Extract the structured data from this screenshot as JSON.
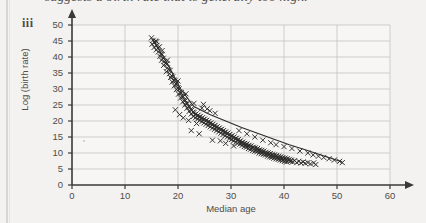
{
  "caption": {
    "text": "suggests a birth rate that is generally too high.",
    "list_marker": "iii"
  },
  "chart_data": {
    "type": "scatter",
    "title": "",
    "xlabel": "Median age",
    "ylabel": "Log (birth rate)",
    "xlim": [
      0,
      60
    ],
    "ylim": [
      0,
      50
    ],
    "xticks": [
      0,
      10,
      20,
      30,
      40,
      50,
      60
    ],
    "yticks": [
      0,
      5,
      10,
      15,
      20,
      25,
      30,
      35,
      40,
      45,
      50
    ],
    "grid": true,
    "grid_color": "#bdbbb8",
    "marker": "x",
    "marker_color": "#2b2a28",
    "axis_color": "#3a3937",
    "axis_arrows": true,
    "legend": "none",
    "trend_line": {
      "visible": true,
      "color": "#2b2a28",
      "x": [
        15.2,
        18.0,
        20.5,
        23.0,
        26.0,
        29.0,
        32.0,
        35.0,
        38.0,
        41.0,
        44.0,
        47.0,
        51.0
      ],
      "y": [
        45.5,
        38.0,
        30.0,
        24.5,
        22.0,
        20.0,
        18.0,
        16.2,
        14.4,
        12.6,
        11.0,
        9.4,
        7.2
      ]
    },
    "points": [
      [
        15.0,
        46.0
      ],
      [
        15.3,
        45.2
      ],
      [
        15.6,
        44.6
      ],
      [
        15.1,
        44.0
      ],
      [
        15.8,
        45.0
      ],
      [
        16.0,
        43.6
      ],
      [
        16.2,
        42.8
      ],
      [
        15.9,
        42.2
      ],
      [
        16.5,
        43.2
      ],
      [
        16.3,
        41.6
      ],
      [
        16.8,
        41.0
      ],
      [
        16.6,
        40.2
      ],
      [
        17.0,
        40.8
      ],
      [
        17.2,
        39.6
      ],
      [
        16.9,
        39.0
      ],
      [
        17.4,
        38.6
      ],
      [
        17.6,
        38.0
      ],
      [
        17.3,
        37.4
      ],
      [
        17.9,
        37.8
      ],
      [
        18.0,
        36.6
      ],
      [
        18.2,
        36.0
      ],
      [
        17.8,
        35.4
      ],
      [
        18.5,
        35.8
      ],
      [
        18.4,
        34.8
      ],
      [
        18.8,
        34.2
      ],
      [
        18.6,
        33.6
      ],
      [
        19.0,
        33.8
      ],
      [
        19.2,
        32.8
      ],
      [
        18.9,
        32.2
      ],
      [
        19.4,
        32.6
      ],
      [
        19.6,
        31.6
      ],
      [
        19.3,
        31.0
      ],
      [
        19.8,
        31.4
      ],
      [
        20.0,
        30.4
      ],
      [
        19.7,
        29.8
      ],
      [
        20.2,
        30.0
      ],
      [
        20.4,
        29.0
      ],
      [
        20.1,
        28.4
      ],
      [
        20.6,
        28.8
      ],
      [
        20.8,
        27.8
      ],
      [
        20.5,
        27.2
      ],
      [
        21.0,
        27.6
      ],
      [
        21.2,
        26.6
      ],
      [
        20.9,
        26.0
      ],
      [
        21.4,
        26.4
      ],
      [
        21.6,
        25.6
      ],
      [
        21.3,
        25.0
      ],
      [
        21.8,
        25.4
      ],
      [
        22.0,
        24.6
      ],
      [
        21.7,
        24.0
      ],
      [
        22.2,
        24.4
      ],
      [
        22.4,
        23.6
      ],
      [
        22.1,
        23.0
      ],
      [
        22.6,
        23.4
      ],
      [
        22.8,
        22.8
      ],
      [
        22.5,
        22.2
      ],
      [
        23.0,
        22.6
      ],
      [
        23.2,
        22.0
      ],
      [
        22.9,
        21.4
      ],
      [
        23.4,
        22.2
      ],
      [
        23.6,
        21.6
      ],
      [
        23.3,
        21.0
      ],
      [
        23.8,
        21.8
      ],
      [
        24.0,
        21.2
      ],
      [
        23.7,
        20.6
      ],
      [
        24.2,
        21.4
      ],
      [
        24.4,
        20.8
      ],
      [
        24.1,
        20.2
      ],
      [
        24.6,
        21.0
      ],
      [
        24.8,
        20.4
      ],
      [
        24.5,
        19.8
      ],
      [
        25.0,
        20.6
      ],
      [
        25.2,
        20.0
      ],
      [
        24.9,
        19.4
      ],
      [
        25.4,
        20.2
      ],
      [
        25.6,
        19.6
      ],
      [
        25.3,
        19.0
      ],
      [
        25.8,
        19.8
      ],
      [
        26.0,
        19.2
      ],
      [
        25.7,
        18.6
      ],
      [
        26.2,
        19.4
      ],
      [
        26.4,
        18.8
      ],
      [
        26.1,
        18.2
      ],
      [
        26.6,
        19.0
      ],
      [
        26.8,
        18.4
      ],
      [
        26.5,
        17.8
      ],
      [
        27.0,
        18.6
      ],
      [
        27.2,
        18.0
      ],
      [
        26.9,
        17.4
      ],
      [
        27.4,
        18.2
      ],
      [
        27.6,
        17.6
      ],
      [
        27.3,
        17.0
      ],
      [
        27.8,
        17.8
      ],
      [
        28.0,
        17.2
      ],
      [
        27.7,
        16.6
      ],
      [
        28.2,
        17.4
      ],
      [
        28.4,
        16.8
      ],
      [
        28.1,
        16.2
      ],
      [
        28.6,
        17.0
      ],
      [
        28.8,
        16.4
      ],
      [
        28.5,
        15.8
      ],
      [
        29.0,
        16.6
      ],
      [
        29.2,
        16.0
      ],
      [
        28.9,
        15.4
      ],
      [
        29.4,
        16.2
      ],
      [
        29.6,
        15.6
      ],
      [
        29.3,
        15.0
      ],
      [
        29.8,
        15.8
      ],
      [
        30.0,
        15.2
      ],
      [
        29.7,
        14.6
      ],
      [
        30.2,
        15.4
      ],
      [
        30.4,
        14.8
      ],
      [
        30.1,
        14.2
      ],
      [
        30.6,
        15.0
      ],
      [
        30.8,
        14.4
      ],
      [
        30.5,
        13.8
      ],
      [
        31.0,
        14.6
      ],
      [
        31.2,
        14.0
      ],
      [
        30.9,
        13.4
      ],
      [
        31.4,
        14.2
      ],
      [
        31.6,
        13.6
      ],
      [
        31.3,
        13.0
      ],
      [
        31.8,
        13.8
      ],
      [
        32.0,
        13.2
      ],
      [
        31.7,
        12.8
      ],
      [
        32.2,
        13.4
      ],
      [
        32.4,
        12.9
      ],
      [
        32.1,
        12.4
      ],
      [
        32.6,
        13.0
      ],
      [
        32.8,
        12.6
      ],
      [
        32.5,
        12.0
      ],
      [
        33.0,
        12.8
      ],
      [
        33.2,
        12.2
      ],
      [
        32.9,
        11.8
      ],
      [
        33.4,
        12.4
      ],
      [
        33.6,
        12.0
      ],
      [
        33.3,
        11.4
      ],
      [
        33.8,
        12.2
      ],
      [
        34.0,
        11.6
      ],
      [
        33.7,
        11.2
      ],
      [
        34.2,
        11.8
      ],
      [
        34.4,
        11.4
      ],
      [
        34.1,
        10.8
      ],
      [
        34.6,
        11.6
      ],
      [
        34.8,
        11.0
      ],
      [
        34.5,
        10.6
      ],
      [
        35.0,
        11.4
      ],
      [
        35.2,
        10.8
      ],
      [
        34.9,
        10.4
      ],
      [
        35.4,
        11.0
      ],
      [
        35.6,
        10.6
      ],
      [
        35.3,
        10.0
      ],
      [
        35.8,
        10.8
      ],
      [
        36.0,
        10.4
      ],
      [
        35.7,
        9.8
      ],
      [
        36.2,
        10.6
      ],
      [
        36.4,
        10.0
      ],
      [
        36.1,
        9.6
      ],
      [
        36.6,
        10.2
      ],
      [
        36.8,
        9.8
      ],
      [
        36.5,
        9.4
      ],
      [
        37.0,
        10.0
      ],
      [
        37.2,
        9.6
      ],
      [
        36.9,
        9.0
      ],
      [
        37.4,
        9.8
      ],
      [
        37.6,
        9.2
      ],
      [
        37.3,
        8.8
      ],
      [
        37.8,
        9.6
      ],
      [
        38.0,
        9.0
      ],
      [
        37.7,
        8.6
      ],
      [
        38.2,
        9.4
      ],
      [
        38.4,
        8.8
      ],
      [
        38.1,
        8.4
      ],
      [
        38.6,
        9.2
      ],
      [
        38.8,
        8.6
      ],
      [
        38.5,
        8.2
      ],
      [
        39.0,
        9.0
      ],
      [
        39.2,
        8.4
      ],
      [
        38.9,
        8.0
      ],
      [
        39.4,
        8.8
      ],
      [
        39.6,
        8.2
      ],
      [
        39.3,
        7.8
      ],
      [
        39.8,
        8.6
      ],
      [
        40.0,
        8.0
      ],
      [
        39.7,
        7.6
      ],
      [
        40.2,
        8.4
      ],
      [
        40.4,
        7.8
      ],
      [
        40.1,
        7.4
      ],
      [
        40.6,
        8.2
      ],
      [
        40.8,
        7.6
      ],
      [
        40.5,
        7.2
      ],
      [
        41.0,
        8.0
      ],
      [
        41.2,
        7.4
      ],
      [
        41.4,
        7.8
      ],
      [
        41.6,
        7.2
      ],
      [
        42.0,
        7.6
      ],
      [
        42.4,
        7.0
      ],
      [
        42.8,
        7.4
      ],
      [
        43.2,
        6.9
      ],
      [
        43.6,
        7.2
      ],
      [
        44.0,
        6.8
      ],
      [
        44.5,
        7.0
      ],
      [
        45.0,
        6.6
      ],
      [
        45.6,
        6.9
      ],
      [
        46.0,
        6.4
      ],
      [
        19.5,
        23.5
      ],
      [
        20.3,
        22.0
      ],
      [
        21.0,
        21.0
      ],
      [
        22.0,
        20.2
      ],
      [
        23.5,
        19.2
      ],
      [
        24.5,
        24.0
      ],
      [
        25.5,
        23.8
      ],
      [
        26.0,
        23.2
      ],
      [
        27.0,
        22.4
      ],
      [
        28.0,
        13.8
      ],
      [
        29.0,
        13.0
      ],
      [
        30.5,
        12.2
      ],
      [
        26.5,
        14.0
      ],
      [
        24.0,
        16.0
      ],
      [
        22.5,
        17.0
      ],
      [
        31.5,
        17.0
      ],
      [
        33.0,
        16.0
      ],
      [
        34.5,
        15.0
      ],
      [
        36.0,
        14.0
      ],
      [
        37.5,
        13.2
      ],
      [
        38.5,
        12.6
      ],
      [
        40.0,
        12.0
      ],
      [
        41.5,
        11.4
      ],
      [
        43.0,
        10.6
      ],
      [
        44.5,
        10.0
      ],
      [
        45.5,
        9.4
      ],
      [
        46.5,
        9.0
      ],
      [
        47.5,
        8.6
      ],
      [
        48.5,
        8.2
      ],
      [
        49.5,
        7.8
      ],
      [
        50.5,
        7.4
      ],
      [
        51.0,
        7.0
      ],
      [
        23.0,
        25.5
      ],
      [
        24.8,
        25.2
      ],
      [
        21.5,
        28.5
      ],
      [
        20.0,
        32.5
      ],
      [
        18.0,
        39.0
      ],
      [
        17.0,
        42.0
      ],
      [
        16.0,
        44.8
      ],
      [
        15.5,
        43.0
      ]
    ]
  }
}
